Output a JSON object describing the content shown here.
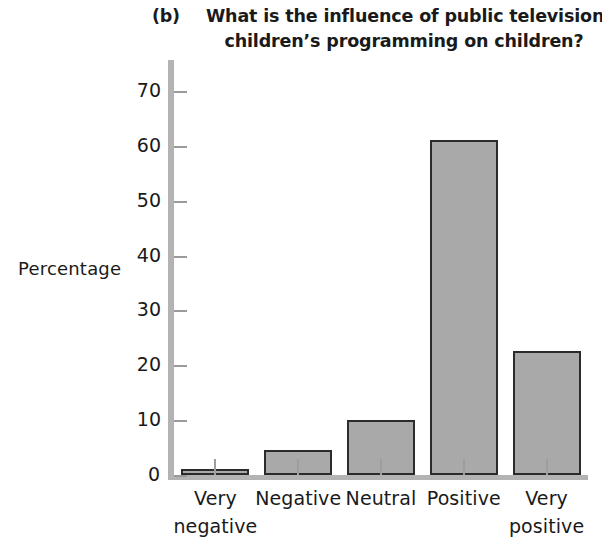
{
  "figure": {
    "panel_letter": "(b)",
    "title_line_1": "What is the influence of public television’s",
    "title_line_2": "children’s programming on children?",
    "y_axis_title": "Percentage"
  },
  "colors": {
    "bar_fill": "#a9a9a9",
    "bar_edge": "#2b2b2b",
    "axis": "#b3b3b3",
    "text": "#1a1a1a",
    "background": "#ffffff"
  },
  "axis": {
    "y_ticks": [
      "0",
      "10",
      "20",
      "30",
      "40",
      "50",
      "60",
      "70"
    ],
    "x_categories": [
      {
        "line1": "Very",
        "line2": "negative"
      },
      {
        "line1": "Negative",
        "line2": ""
      },
      {
        "line1": "Neutral",
        "line2": ""
      },
      {
        "line1": "Positive",
        "line2": ""
      },
      {
        "line1": "Very",
        "line2": "positive"
      }
    ]
  },
  "chart_data": {
    "type": "bar",
    "title": "(b) What is the influence of public television’s children’s programming on children?",
    "xlabel": "",
    "ylabel": "Percentage",
    "categories": [
      "Very negative",
      "Negative",
      "Neutral",
      "Positive",
      "Very positive"
    ],
    "values": [
      1,
      4.6,
      10,
      61,
      22.6
    ],
    "ylim": [
      0,
      75
    ],
    "ytick_step": 10,
    "ytick_values": [
      0,
      10,
      20,
      30,
      40,
      50,
      60,
      70
    ],
    "grid": false,
    "legend": false,
    "series": [
      {
        "name": "Percentage",
        "values": [
          1,
          4.6,
          10,
          61,
          22.6
        ]
      }
    ]
  }
}
